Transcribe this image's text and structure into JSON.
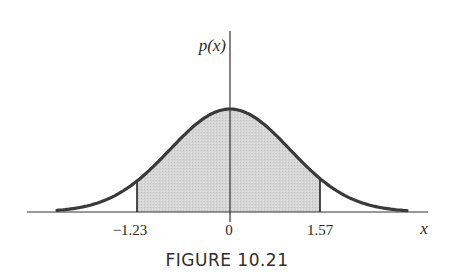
{
  "chart_data": {
    "type": "area",
    "title": "",
    "caption": "FIGURE 10.21",
    "xlabel": "x",
    "ylabel": "p(x)",
    "curve": "normal density (bell curve) centered at 0",
    "x_ticks": [
      {
        "value": -1.23,
        "label": "−1.23"
      },
      {
        "value": 0,
        "label": "0"
      },
      {
        "value": 1.57,
        "label": "1.57"
      }
    ],
    "shaded_region": {
      "from": -1.23,
      "to": 1.57,
      "label": "P(-1.23 < x < 1.57)"
    },
    "grid": false,
    "legend": null,
    "colors": {
      "curve": "#3a3a3a",
      "shade": "#d4d4d4",
      "axis": "#333333"
    }
  },
  "figure": {
    "ylabel": "p(x)",
    "xlabel": "x",
    "ticks": {
      "left": "−1.23",
      "center": "0",
      "right": "1.57"
    },
    "caption": "FIGURE 10.21"
  }
}
